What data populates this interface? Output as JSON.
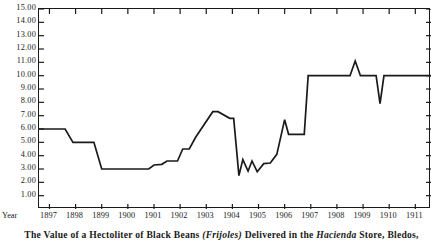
{
  "caption": {
    "part1": "The Value of a Hectoliter of Black Beans ",
    "italic1": "(Frijoles)",
    "part2": " Delivered in the ",
    "italic2": "Hacienda",
    "part3": " Store, Bledos,"
  },
  "axes": {
    "x_title": "Year",
    "y_tick_labels": [
      "15.00",
      "14.00",
      "13.00",
      "12.00",
      "11.00",
      "10.00",
      "9.00",
      "8.00",
      "7.00",
      "6.00",
      "5.00",
      "4.00",
      "3.00",
      "2.00",
      "1.00"
    ],
    "x_tick_labels": [
      "1897",
      "1898",
      "1899",
      "1900",
      "1901",
      "1902",
      "1903",
      "1904",
      "1905",
      "1906",
      "1907",
      "1908",
      "1909",
      "1910",
      "1911"
    ]
  },
  "chart_data": {
    "type": "line",
    "title": "The Value of a Hectoliter of Black Beans (Frijoles) Delivered in the Hacienda Store, Bledos,",
    "xlabel": "Year",
    "ylabel": "",
    "xlim": [
      1896.6,
      1911.6
    ],
    "ylim": [
      0,
      15
    ],
    "grid": false,
    "legend": null,
    "line_color": "#1a1a1a",
    "step_style": "post",
    "x": [
      1896.6,
      1897.6,
      1897.9,
      1898.7,
      1899.0,
      1900.8,
      1901.0,
      1901.3,
      1901.5,
      1901.9,
      1902.1,
      1902.35,
      1902.6,
      1903.25,
      1903.45,
      1903.9,
      1904.05,
      1904.25,
      1904.4,
      1904.6,
      1904.75,
      1904.95,
      1905.2,
      1905.45,
      1905.7,
      1906.0,
      1906.15,
      1906.35,
      1906.75,
      1906.9,
      1908.5,
      1908.7,
      1908.9,
      1909.5,
      1909.65,
      1909.8,
      1911.6
    ],
    "y": [
      6.0,
      6.0,
      5.0,
      5.0,
      3.0,
      3.0,
      3.3,
      3.35,
      3.6,
      3.6,
      4.5,
      4.5,
      5.4,
      7.3,
      7.3,
      6.8,
      6.8,
      2.5,
      3.7,
      2.85,
      3.6,
      2.8,
      3.4,
      3.45,
      4.1,
      6.7,
      5.6,
      5.6,
      5.6,
      10.0,
      10.0,
      11.1,
      10.0,
      10.0,
      7.9,
      10.0,
      10.0
    ],
    "series": [
      {
        "name": "Hectoliter value (pesos)",
        "points": [
          {
            "year": 1897,
            "value": 6.0
          },
          {
            "year": 1898,
            "value": 5.0
          },
          {
            "year": 1899,
            "value": 3.0
          },
          {
            "year": 1900,
            "value": 3.0
          },
          {
            "year": 1901,
            "value": 3.6
          },
          {
            "year": 1902,
            "value": 4.5
          },
          {
            "year": 1903,
            "value": 7.3
          },
          {
            "year": 1904,
            "value": 6.8
          },
          {
            "year": 1905,
            "value": 3.0
          },
          {
            "year": 1906,
            "value": 5.6
          },
          {
            "year": 1907,
            "value": 10.0
          },
          {
            "year": 1908,
            "value": 10.0
          },
          {
            "year": 1909,
            "value": 11.1
          },
          {
            "year": 1910,
            "value": 10.0
          },
          {
            "year": 1911,
            "value": 10.0
          }
        ]
      }
    ]
  }
}
